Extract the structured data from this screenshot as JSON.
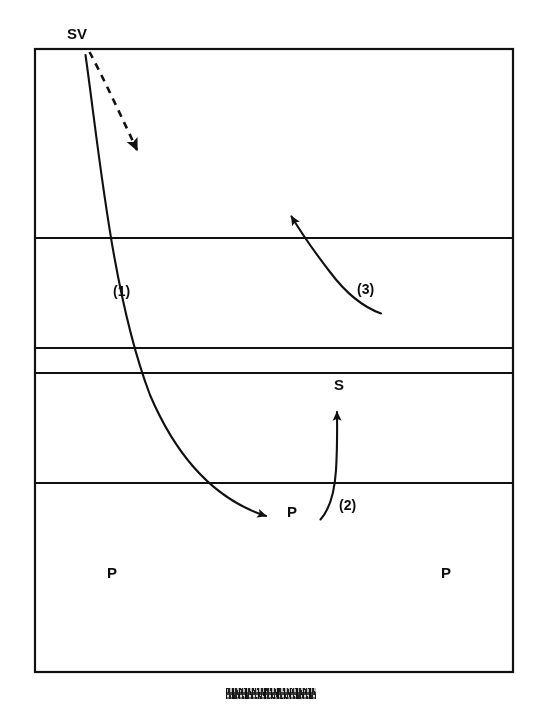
{
  "diagram": {
    "type": "volleyball-court-play-diagram",
    "background_color": "#ffffff",
    "line_color": "#111111",
    "court": {
      "x": 35,
      "y": 49,
      "width": 478,
      "height": 623,
      "border_width": 2,
      "horizontal_lines": [
        {
          "name": "attack-line-far",
          "y": 238
        },
        {
          "name": "center-line-upper",
          "y": 348
        },
        {
          "name": "center-line-lower",
          "y": 373
        },
        {
          "name": "attack-line-near",
          "y": 483
        }
      ]
    },
    "player_labels": [
      {
        "id": "server",
        "text": "SV",
        "x": 67,
        "y": 26
      },
      {
        "id": "setter",
        "text": "S",
        "x": 334,
        "y": 377
      },
      {
        "id": "passer-center",
        "text": "P",
        "x": 287,
        "y": 504
      },
      {
        "id": "passer-left",
        "text": "P",
        "x": 107,
        "y": 565
      },
      {
        "id": "passer-right",
        "text": "P",
        "x": 441,
        "y": 565
      }
    ],
    "movement_labels": [
      {
        "id": "step-1",
        "text": "(1)",
        "x": 113,
        "y": 284
      },
      {
        "id": "step-2",
        "text": "(2)",
        "x": 339,
        "y": 498
      },
      {
        "id": "step-3",
        "text": "(3)",
        "x": 357,
        "y": 282
      }
    ],
    "arrows": [
      {
        "id": "serve-trajectory-dashed",
        "style": "dashed",
        "label": "",
        "from": [
          89,
          52
        ],
        "to": [
          142,
          158
        ],
        "description": "dashed serve direction arrow from SV heading down-right"
      },
      {
        "id": "serve-path-1",
        "style": "solid-curved",
        "label": "(1)",
        "from": [
          85,
          55
        ],
        "to": [
          272,
          520
        ],
        "description": "curved solid arrow: ball served from SV travelling down to the passer P"
      },
      {
        "id": "pass-path-2",
        "style": "solid-curved",
        "label": "(2)",
        "from": [
          320,
          519
        ],
        "to": [
          337,
          404
        ],
        "description": "curved solid arrow: pass from P up to the setter S"
      },
      {
        "id": "set-path-3",
        "style": "solid-curved",
        "label": "(3)",
        "from": [
          381,
          313
        ],
        "to": [
          288,
          210
        ],
        "description": "curved solid arrow: set travelling up-left across the net"
      }
    ],
    "caption_artifact": {
      "id": "bottom-caption-smudge",
      "text": "",
      "legible": false,
      "x": 226,
      "y": 688,
      "width": 90,
      "height": 11,
      "description": "illegible scanned caption text smudge below the court"
    }
  }
}
